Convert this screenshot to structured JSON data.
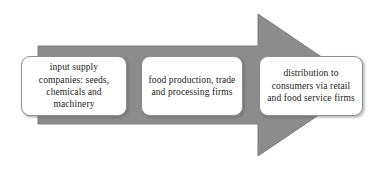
{
  "diagram": {
    "arrow": {
      "name": "right-block-arrow",
      "fill_color": "#8c8c8c",
      "stroke_color": "#7a7a7a",
      "direction": "right",
      "body": {
        "x": 38,
        "y": 46,
        "width": 220,
        "height": 78
      },
      "head": {
        "x": 258,
        "y": 14,
        "tip_x": 363,
        "height": 142
      }
    },
    "stages": [
      {
        "id": "input-supply",
        "label": "input supply companies: seeds, chemicals and machinery",
        "lines": [
          "input supply",
          "companies: seeds,",
          "chemicals and",
          "machinery"
        ]
      },
      {
        "id": "production-processing",
        "label": "food production, trade and processing firms",
        "lines": [
          "food production,",
          "trade and processing",
          "firms"
        ]
      },
      {
        "id": "distribution",
        "label": "distribution to consumers via retail and food service firms",
        "lines": [
          "distribution to",
          "consumers via retail",
          "and food service",
          "firms"
        ]
      }
    ],
    "colors": {
      "background": "#ffffff",
      "arrow_fill": "#8c8c8c",
      "box_fill": "#ffffff",
      "box_border": "#8e8e8e",
      "text": "#1b1b1b"
    }
  }
}
